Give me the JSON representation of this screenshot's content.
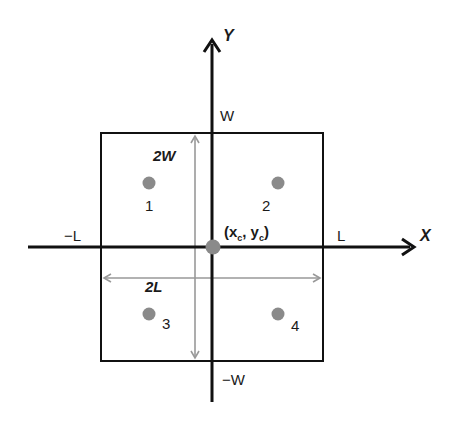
{
  "diagram": {
    "axes": {
      "x_label": "X",
      "y_label": "Y"
    },
    "bounds": {
      "top": "W",
      "bottom": "−W",
      "left": "−L",
      "right": "L"
    },
    "dimensions": {
      "height_label": "2W",
      "width_label": "2L"
    },
    "center": {
      "label_x": "x",
      "label_y": "y",
      "subscript": "c",
      "open": "(",
      "comma": ",",
      "close": ")"
    },
    "points": [
      {
        "id": "1",
        "label": "1"
      },
      {
        "id": "2",
        "label": "2"
      },
      {
        "id": "3",
        "label": "3"
      },
      {
        "id": "4",
        "label": "4"
      }
    ],
    "colors": {
      "axis": "#111111",
      "dimension_arrow": "#999999",
      "point": "#8a8a8a"
    }
  }
}
